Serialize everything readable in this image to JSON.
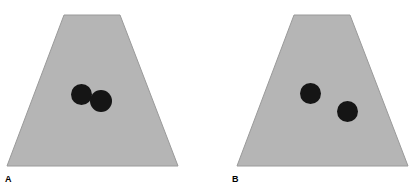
{
  "figure": {
    "background_color": "#ffffff",
    "width": 417,
    "height": 194,
    "clipped_header_text": "",
    "shape_fill_color": "#b5b5b5",
    "shape_edge_color": "#9a9a9a",
    "circle_color": "#151515"
  },
  "panels": [
    {
      "label": "A",
      "shape": {
        "name": "trapezoid",
        "points": "64,15 120,15 178,166 7,166"
      },
      "circles": [
        {
          "name": "circle-1",
          "cx": 81.5,
          "cy": 94.5,
          "r": 10.5
        },
        {
          "name": "circle-2",
          "cx": 101,
          "cy": 101,
          "r": 11
        }
      ],
      "arrangement": "touching"
    },
    {
      "label": "B",
      "shape": {
        "name": "trapezoid",
        "points": "86,15 142,15 200,166 29,166"
      },
      "circles": [
        {
          "name": "circle-1",
          "cx": 102.5,
          "cy": 93.5,
          "r": 10.5
        },
        {
          "name": "circle-2",
          "cx": 139.5,
          "cy": 111.5,
          "r": 10.5
        }
      ],
      "arrangement": "separated"
    }
  ]
}
